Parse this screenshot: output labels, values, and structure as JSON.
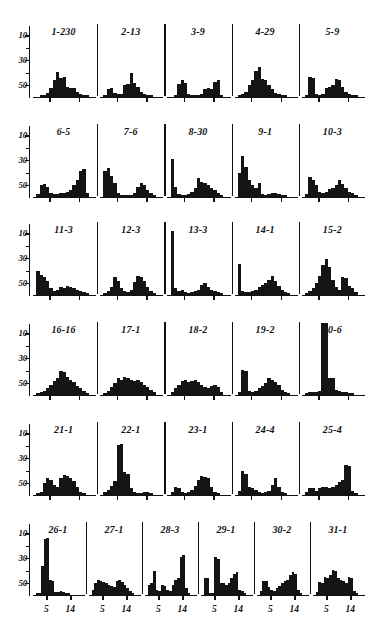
{
  "chart_data": {
    "type": "bar",
    "title": "",
    "xlabel": "",
    "ylabel": "",
    "ylim": [
      0,
      58
    ],
    "xlim": [
      0,
      18
    ],
    "grid": false,
    "legend": null,
    "y_ticks_major": [
      10,
      30,
      50
    ],
    "y_ticks_minor": [
      20,
      40
    ],
    "x_tick_labels": [
      "5",
      "14"
    ],
    "x_tick_positions": [
      5,
      14
    ],
    "bin_count": 18,
    "panel_rows": 6,
    "panels_per_row": [
      5,
      5,
      5,
      5,
      5,
      6
    ],
    "panels": [
      {
        "label": "1-230",
        "values": [
          0,
          0,
          1,
          1,
          3,
          7,
          13,
          20,
          15,
          16,
          8,
          7,
          7,
          4,
          2,
          1,
          1,
          0
        ]
      },
      {
        "label": "2-13",
        "values": [
          0,
          1,
          6,
          7,
          3,
          2,
          2,
          9,
          10,
          19,
          11,
          8,
          4,
          2,
          1,
          1,
          0,
          0
        ]
      },
      {
        "label": "3-9",
        "values": [
          0,
          0,
          1,
          10,
          13,
          11,
          2,
          1,
          1,
          1,
          2,
          6,
          7,
          6,
          12,
          13,
          1,
          0
        ]
      },
      {
        "label": "4-29",
        "values": [
          0,
          1,
          2,
          4,
          9,
          13,
          21,
          24,
          14,
          13,
          9,
          6,
          3,
          2,
          1,
          1,
          0,
          0
        ]
      },
      {
        "label": "5-9",
        "values": [
          0,
          1,
          16,
          15,
          2,
          1,
          2,
          7,
          8,
          9,
          14,
          13,
          8,
          4,
          2,
          1,
          1,
          0
        ]
      },
      {
        "label": "6-5",
        "values": [
          0,
          2,
          9,
          10,
          8,
          3,
          2,
          2,
          3,
          3,
          4,
          5,
          9,
          13,
          21,
          22,
          3,
          0
        ]
      },
      {
        "label": "7-6",
        "values": [
          0,
          21,
          23,
          17,
          11,
          3,
          1,
          1,
          1,
          1,
          3,
          8,
          11,
          9,
          5,
          3,
          1,
          0
        ]
      },
      {
        "label": "8-30",
        "values": [
          0,
          30,
          8,
          2,
          1,
          1,
          2,
          4,
          7,
          15,
          12,
          11,
          9,
          7,
          5,
          3,
          1,
          0
        ]
      },
      {
        "label": "9-1",
        "values": [
          0,
          19,
          33,
          24,
          13,
          9,
          7,
          11,
          2,
          1,
          2,
          3,
          3,
          2,
          1,
          1,
          0,
          0
        ]
      },
      {
        "label": "10-3",
        "values": [
          0,
          2,
          16,
          13,
          9,
          4,
          3,
          4,
          6,
          7,
          9,
          13,
          10,
          7,
          4,
          3,
          1,
          0
        ]
      },
      {
        "label": "11-3",
        "values": [
          0,
          19,
          16,
          14,
          11,
          5,
          3,
          4,
          6,
          5,
          7,
          6,
          5,
          4,
          3,
          2,
          1,
          0
        ]
      },
      {
        "label": "12-3",
        "values": [
          0,
          1,
          3,
          6,
          14,
          11,
          5,
          3,
          2,
          4,
          10,
          15,
          14,
          11,
          6,
          3,
          1,
          0
        ]
      },
      {
        "label": "13-3",
        "values": [
          0,
          51,
          5,
          3,
          4,
          2,
          1,
          2,
          3,
          4,
          8,
          9,
          6,
          4,
          3,
          2,
          1,
          0
        ]
      },
      {
        "label": "14-1",
        "values": [
          0,
          25,
          3,
          2,
          2,
          3,
          4,
          6,
          8,
          9,
          12,
          15,
          11,
          7,
          4,
          2,
          1,
          0
        ]
      },
      {
        "label": "15-2",
        "values": [
          0,
          1,
          3,
          5,
          9,
          15,
          24,
          29,
          22,
          12,
          6,
          4,
          14,
          13,
          7,
          5,
          2,
          0
        ]
      },
      {
        "label": "16-16",
        "values": [
          0,
          1,
          2,
          3,
          5,
          8,
          11,
          13,
          19,
          18,
          14,
          12,
          10,
          7,
          5,
          3,
          1,
          0
        ]
      },
      {
        "label": "17-1",
        "values": [
          0,
          1,
          3,
          6,
          9,
          13,
          12,
          14,
          13,
          12,
          11,
          12,
          10,
          8,
          6,
          4,
          2,
          0
        ]
      },
      {
        "label": "18-2",
        "values": [
          0,
          2,
          5,
          8,
          11,
          12,
          10,
          11,
          12,
          10,
          8,
          6,
          5,
          7,
          8,
          6,
          2,
          0
        ]
      },
      {
        "label": "19-2",
        "values": [
          0,
          2,
          20,
          19,
          3,
          2,
          3,
          5,
          7,
          9,
          13,
          12,
          10,
          8,
          4,
          2,
          1,
          0
        ]
      },
      {
        "label": "20-6",
        "values": [
          0,
          1,
          2,
          2,
          2,
          3,
          58,
          58,
          13,
          13,
          4,
          3,
          2,
          2,
          1,
          1,
          0,
          0
        ]
      },
      {
        "label": "21-1",
        "values": [
          0,
          1,
          2,
          9,
          13,
          12,
          8,
          6,
          13,
          16,
          15,
          13,
          11,
          6,
          2,
          1,
          0,
          0
        ]
      },
      {
        "label": "22-1",
        "values": [
          0,
          2,
          4,
          7,
          11,
          40,
          41,
          18,
          17,
          5,
          2,
          1,
          1,
          2,
          2,
          1,
          0,
          0
        ]
      },
      {
        "label": "23-1",
        "values": [
          0,
          2,
          6,
          5,
          2,
          1,
          2,
          4,
          7,
          12,
          15,
          14,
          13,
          6,
          2,
          1,
          0,
          0
        ]
      },
      {
        "label": "24-4",
        "values": [
          0,
          3,
          19,
          17,
          6,
          5,
          4,
          2,
          1,
          2,
          3,
          8,
          13,
          6,
          2,
          1,
          0,
          0
        ]
      },
      {
        "label": "25-4",
        "values": [
          0,
          2,
          5,
          5,
          3,
          5,
          6,
          6,
          5,
          6,
          8,
          10,
          12,
          24,
          23,
          3,
          1,
          0
        ]
      },
      {
        "label": "26-1",
        "values": [
          0,
          1,
          1,
          23,
          45,
          46,
          12,
          11,
          2,
          2,
          3,
          2,
          1,
          1,
          0,
          0,
          0,
          0
        ]
      },
      {
        "label": "27-1",
        "values": [
          0,
          4,
          9,
          12,
          11,
          10,
          9,
          8,
          7,
          6,
          11,
          12,
          10,
          8,
          5,
          3,
          1,
          0
        ]
      },
      {
        "label": "28-3",
        "values": [
          0,
          8,
          9,
          19,
          4,
          3,
          8,
          7,
          4,
          3,
          8,
          12,
          13,
          30,
          32,
          5,
          1,
          0
        ]
      },
      {
        "label": "29-1",
        "values": [
          0,
          13,
          13,
          1,
          1,
          30,
          29,
          9,
          9,
          8,
          9,
          13,
          17,
          18,
          4,
          3,
          1,
          0
        ]
      },
      {
        "label": "30-2",
        "values": [
          0,
          3,
          11,
          11,
          6,
          4,
          3,
          5,
          7,
          9,
          11,
          12,
          16,
          18,
          17,
          4,
          1,
          0
        ]
      },
      {
        "label": "31-1",
        "values": [
          0,
          2,
          10,
          9,
          14,
          13,
          16,
          20,
          19,
          13,
          12,
          11,
          9,
          14,
          13,
          3,
          1,
          0
        ]
      }
    ]
  },
  "axis": {
    "y_labels": [
      "50",
      "30",
      "10"
    ],
    "x_labels": [
      "5",
      "14"
    ]
  }
}
